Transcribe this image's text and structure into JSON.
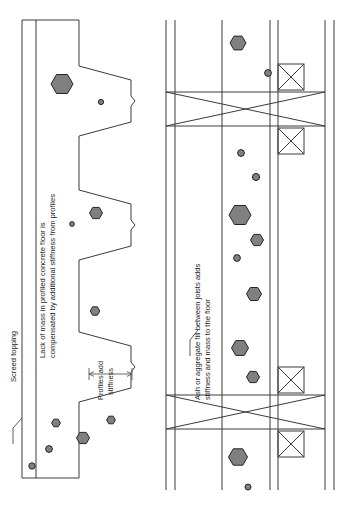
{
  "figure": {
    "type": "construction-section-diagram",
    "orientation": "rotated-90-ccw",
    "colors": {
      "line": "#3a3a3a",
      "aggregate_fill": "#808080",
      "aggregate_stroke": "#262626",
      "text": "#1c1c1c",
      "background": "#ffffff"
    }
  },
  "labels": {
    "screed_topping": "Screed topping",
    "lack_of_mass_line1": "Lack of mass in profiled concrete floor is",
    "lack_of_mass_line2": "compensated by additional stiffness from profiles",
    "profiles_add_line1": "Profiles add",
    "profiles_add_line2": "stiffness",
    "ash_fill_line1": "Ash or aggregate fill between joists adds",
    "ash_fill_line2": "stiffness and mass to the floor"
  },
  "left_panel": {
    "name": "profiled-concrete-floor",
    "screed_layer": {
      "edge_outer_x": 22,
      "edge_inner_x": 36,
      "top_y": 20,
      "bottom_y": 478
    },
    "deck_profile_description": "trapezoidal profiled steel deck with three troughs",
    "dimension_label": "Profiles add stiffness",
    "aggregate_particles": [
      {
        "cx": 62,
        "cy": 84,
        "r": 11,
        "shape": "hexagon"
      },
      {
        "cx": 101,
        "cy": 102,
        "r": 2.6,
        "shape": "circle"
      },
      {
        "cx": 96,
        "cy": 213,
        "r": 6.5,
        "shape": "hexagon"
      },
      {
        "cx": 72,
        "cy": 224,
        "r": 2.4,
        "shape": "circle"
      },
      {
        "cx": 95,
        "cy": 311,
        "r": 4.8,
        "shape": "hexagon"
      },
      {
        "cx": 56,
        "cy": 423,
        "r": 4.4,
        "shape": "hexagon"
      },
      {
        "cx": 111,
        "cy": 420,
        "r": 4.4,
        "shape": "hexagon"
      },
      {
        "cx": 83,
        "cy": 438,
        "r": 6.5,
        "shape": "hexagon"
      },
      {
        "cx": 49,
        "cy": 449,
        "r": 3.4,
        "shape": "circle"
      },
      {
        "cx": 32,
        "cy": 466,
        "r": 3.2,
        "shape": "circle"
      }
    ]
  },
  "right_panel": {
    "name": "timber-joist-floor-with-fill",
    "joist_lines_x": [
      166,
      175,
      222,
      270,
      278,
      325,
      334
    ],
    "x_brace_bands": [
      {
        "top_y": 92,
        "bottom_y": 126
      },
      {
        "top_y": 395,
        "bottom_y": 429
      }
    ],
    "noggin_boxes": [
      {
        "x": 278,
        "y": 64,
        "w": 26,
        "h": 26
      },
      {
        "x": 278,
        "y": 128,
        "w": 26,
        "h": 26
      },
      {
        "x": 278,
        "y": 367,
        "w": 26,
        "h": 26
      },
      {
        "x": 278,
        "y": 431,
        "w": 26,
        "h": 26
      }
    ],
    "aggregate_particles": [
      {
        "cx": 238,
        "cy": 43,
        "r": 8,
        "shape": "hexagon"
      },
      {
        "cx": 268,
        "cy": 73,
        "r": 3.4,
        "shape": "circle"
      },
      {
        "cx": 241,
        "cy": 153,
        "r": 3.4,
        "shape": "circle"
      },
      {
        "cx": 256,
        "cy": 177,
        "r": 3.6,
        "shape": "circle"
      },
      {
        "cx": 240,
        "cy": 215,
        "r": 11,
        "shape": "hexagon"
      },
      {
        "cx": 257,
        "cy": 240,
        "r": 6.5,
        "shape": "hexagon"
      },
      {
        "cx": 237,
        "cy": 258,
        "r": 3.4,
        "shape": "circle"
      },
      {
        "cx": 254,
        "cy": 294,
        "r": 7.5,
        "shape": "hexagon"
      },
      {
        "cx": 240,
        "cy": 348,
        "r": 8.5,
        "shape": "hexagon"
      },
      {
        "cx": 253,
        "cy": 377,
        "r": 6.5,
        "shape": "hexagon"
      },
      {
        "cx": 238,
        "cy": 457,
        "r": 9.5,
        "shape": "hexagon"
      },
      {
        "cx": 248,
        "cy": 487,
        "r": 3,
        "shape": "circle"
      }
    ]
  }
}
